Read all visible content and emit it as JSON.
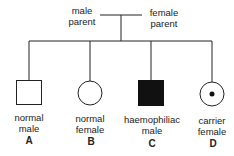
{
  "parents": {
    "male": {
      "line1": "male",
      "line2": "parent"
    },
    "female": {
      "line1": "female",
      "line2": "parent"
    }
  },
  "offspring": [
    {
      "letter": "A",
      "line1": "normal",
      "line2": "male",
      "symbol": "square-open"
    },
    {
      "letter": "B",
      "line1": "normal",
      "line2": "female",
      "symbol": "circle-open"
    },
    {
      "letter": "C",
      "line1": "haemophiliac",
      "line2": "male",
      "symbol": "square-filled"
    },
    {
      "letter": "D",
      "line1": "carrier",
      "line2": "female",
      "symbol": "circle-dot"
    }
  ],
  "colors": {
    "line": "#222222",
    "fill": "#111111"
  }
}
